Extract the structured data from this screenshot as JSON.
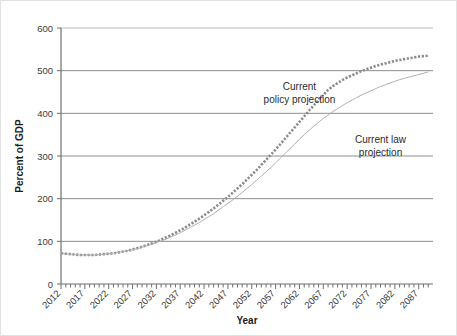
{
  "chart_data": {
    "type": "line",
    "title": "",
    "xlabel": "Year",
    "ylabel": "Percent of GDP",
    "xlim": [
      2012,
      2090
    ],
    "ylim": [
      0,
      600
    ],
    "yticks": [
      0,
      100,
      200,
      300,
      400,
      500,
      600
    ],
    "xticks": [
      2012,
      2017,
      2022,
      2027,
      2032,
      2037,
      2042,
      2047,
      2052,
      2057,
      2062,
      2067,
      2072,
      2077,
      2082,
      2087
    ],
    "xtick_minor_step": 1,
    "grid": "horizontal",
    "legend_position": "inline-annotations",
    "annotations": [
      {
        "name": "current-policy-annotation",
        "text_line1": "Current",
        "text_line2": "policy projection",
        "x": 2062,
        "y": 455
      },
      {
        "name": "current-law-annotation",
        "text_line1": "Current law",
        "text_line2": "projection",
        "x": 2079,
        "y": 330
      }
    ],
    "series": [
      {
        "name": "Current policy projection",
        "style": "dotted-square-markers",
        "color": "#8c8c8c",
        "x": [
          2012,
          2013,
          2014,
          2015,
          2016,
          2017,
          2018,
          2019,
          2020,
          2021,
          2022,
          2023,
          2024,
          2025,
          2026,
          2027,
          2028,
          2029,
          2030,
          2031,
          2032,
          2033,
          2034,
          2035,
          2036,
          2037,
          2038,
          2039,
          2040,
          2041,
          2042,
          2043,
          2044,
          2045,
          2046,
          2047,
          2048,
          2049,
          2050,
          2051,
          2052,
          2053,
          2054,
          2055,
          2056,
          2057,
          2058,
          2059,
          2060,
          2061,
          2062,
          2063,
          2064,
          2065,
          2066,
          2067,
          2068,
          2069,
          2070,
          2071,
          2072,
          2073,
          2074,
          2075,
          2076,
          2077,
          2078,
          2079,
          2080,
          2081,
          2082,
          2083,
          2084,
          2085,
          2086,
          2087,
          2088,
          2089
        ],
        "values": [
          72,
          71,
          70,
          69,
          68,
          68,
          68,
          68,
          69,
          70,
          71,
          72,
          74,
          76,
          78,
          81,
          84,
          87,
          91,
          95,
          99,
          104,
          109,
          114,
          120,
          126,
          132,
          139,
          146,
          153,
          161,
          169,
          177,
          186,
          195,
          204,
          214,
          224,
          234,
          245,
          256,
          267,
          279,
          291,
          303,
          315,
          328,
          341,
          354,
          367,
          380,
          393,
          406,
          419,
          431,
          443,
          455,
          464,
          471,
          478,
          484,
          489,
          494,
          499,
          503,
          507,
          511,
          514,
          517,
          520,
          523,
          525,
          527,
          529,
          531,
          533,
          534,
          535
        ]
      },
      {
        "name": "Current law projection",
        "style": "thin-solid",
        "color": "#b0b0b0",
        "x": [
          2012,
          2013,
          2014,
          2015,
          2016,
          2017,
          2018,
          2019,
          2020,
          2021,
          2022,
          2023,
          2024,
          2025,
          2026,
          2027,
          2028,
          2029,
          2030,
          2031,
          2032,
          2033,
          2034,
          2035,
          2036,
          2037,
          2038,
          2039,
          2040,
          2041,
          2042,
          2043,
          2044,
          2045,
          2046,
          2047,
          2048,
          2049,
          2050,
          2051,
          2052,
          2053,
          2054,
          2055,
          2056,
          2057,
          2058,
          2059,
          2060,
          2061,
          2062,
          2063,
          2064,
          2065,
          2066,
          2067,
          2068,
          2069,
          2070,
          2071,
          2072,
          2073,
          2074,
          2075,
          2076,
          2077,
          2078,
          2079,
          2080,
          2081,
          2082,
          2083,
          2084,
          2085,
          2086,
          2087,
          2088,
          2089
        ],
        "values": [
          72,
          71,
          70,
          69,
          68,
          68,
          68,
          68,
          69,
          70,
          71,
          72,
          74,
          76,
          78,
          80,
          83,
          86,
          89,
          93,
          97,
          101,
          105,
          110,
          115,
          120,
          126,
          132,
          138,
          144,
          151,
          158,
          165,
          173,
          181,
          189,
          197,
          206,
          215,
          224,
          233,
          243,
          253,
          263,
          273,
          284,
          295,
          306,
          317,
          328,
          339,
          350,
          360,
          370,
          379,
          388,
          396,
          404,
          411,
          418,
          425,
          431,
          437,
          443,
          448,
          453,
          458,
          463,
          467,
          471,
          475,
          479,
          482,
          485,
          488,
          491,
          494,
          497
        ]
      }
    ]
  }
}
